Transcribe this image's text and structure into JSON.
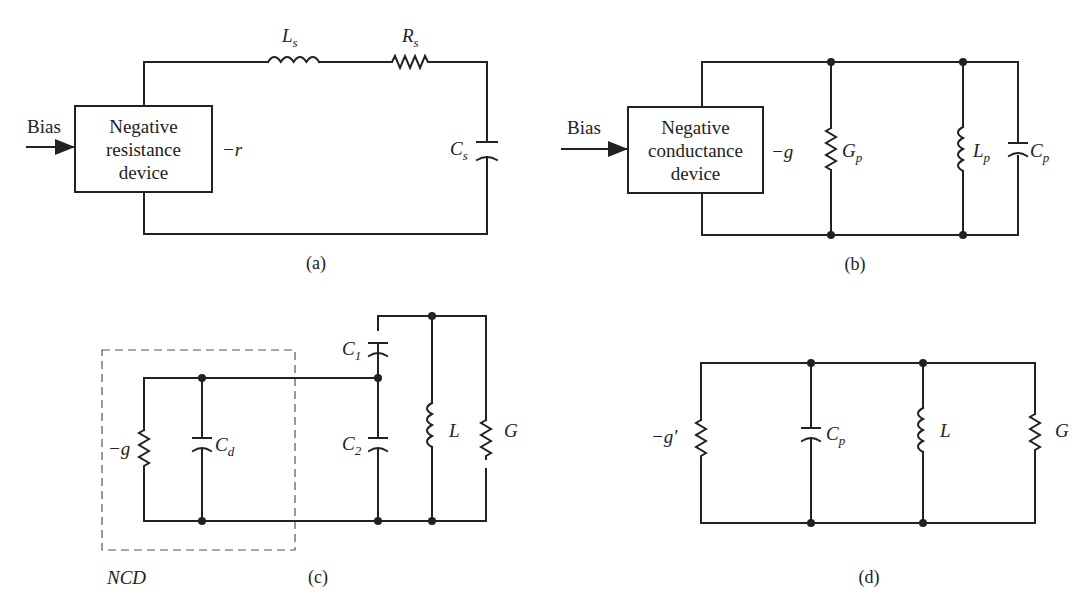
{
  "figures": {
    "a": {
      "caption": "(a)",
      "input_label": "Bias",
      "device_lines": [
        "Negative",
        "resistance",
        "device"
      ],
      "device_value": "−r",
      "components": [
        {
          "type": "inductor",
          "symbol": "L",
          "sub": "s"
        },
        {
          "type": "resistor",
          "symbol": "R",
          "sub": "s"
        },
        {
          "type": "capacitor",
          "symbol": "C",
          "sub": "s"
        }
      ]
    },
    "b": {
      "caption": "(b)",
      "input_label": "Bias",
      "device_lines": [
        "Negative",
        "conductance",
        "device"
      ],
      "device_value": "−g",
      "components": [
        {
          "type": "resistor",
          "symbol": "G",
          "sub": "p"
        },
        {
          "type": "inductor",
          "symbol": "L",
          "sub": "p"
        },
        {
          "type": "capacitor",
          "symbol": "C",
          "sub": "p"
        }
      ]
    },
    "c": {
      "caption": "(c)",
      "box_label": "NCD",
      "components": [
        {
          "type": "resistor",
          "symbol": "−g",
          "sub": ""
        },
        {
          "type": "capacitor",
          "symbol": "C",
          "sub": "d"
        },
        {
          "type": "capacitor",
          "symbol": "C",
          "sub": "1"
        },
        {
          "type": "capacitor",
          "symbol": "C",
          "sub": "2"
        },
        {
          "type": "inductor",
          "symbol": "L",
          "sub": ""
        },
        {
          "type": "resistor",
          "symbol": "G",
          "sub": ""
        }
      ]
    },
    "d": {
      "caption": "(d)",
      "components": [
        {
          "type": "resistor",
          "symbol": "−g′",
          "sub": ""
        },
        {
          "type": "capacitor",
          "symbol": "C",
          "sub": "p"
        },
        {
          "type": "inductor",
          "symbol": "L",
          "sub": ""
        },
        {
          "type": "resistor",
          "symbol": "G",
          "sub": ""
        }
      ]
    }
  }
}
